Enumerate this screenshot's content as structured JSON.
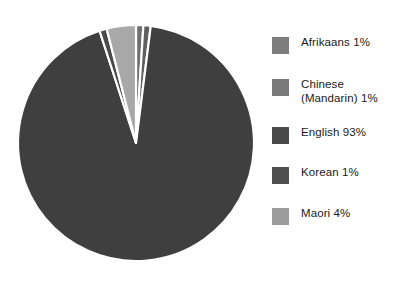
{
  "chart_data": {
    "type": "pie",
    "title": "",
    "subtitle": "",
    "xlabel": "",
    "ylabel": "",
    "legend_position": "right",
    "grid": false,
    "start_angle_deg": 0,
    "direction": "clockwise",
    "categories": [
      "Afrikaans",
      "Chinese (Mandarin)",
      "English",
      "Korean",
      "Maori"
    ],
    "values": [
      1,
      1,
      93,
      1,
      4
    ],
    "units": "percent",
    "slice_colors": [
      "#6f6f6f",
      "#5f5f5f",
      "#3f3f3f",
      "#4a4a4a",
      "#a8a8a8"
    ],
    "separator_color": "#ffffff",
    "slices": [
      {
        "label": "Afrikaans",
        "value": 1,
        "value_text": "1%",
        "color": "#6f6f6f"
      },
      {
        "label": "Chinese (Mandarin)",
        "value": 1,
        "value_text": "1%",
        "color": "#5f5f5f"
      },
      {
        "label": "English",
        "value": 93,
        "value_text": "93%",
        "color": "#3f3f3f"
      },
      {
        "label": "Korean",
        "value": 1,
        "value_text": "1%",
        "color": "#4a4a4a"
      },
      {
        "label": "Maori",
        "value": 4,
        "value_text": "4%",
        "color": "#a8a8a8"
      }
    ]
  },
  "legend": {
    "items": [
      {
        "text": "Afrikaans 1%",
        "swatch": "#7d7d7d",
        "top": 6
      },
      {
        "text": "Chinese\n(Mandarin) 1%",
        "swatch": "#7a7a7a",
        "top": 48
      },
      {
        "text": "English 93%",
        "swatch": "#494949",
        "top": 96
      },
      {
        "text": "Korean 1%",
        "swatch": "#4f4f4f",
        "top": 136
      },
      {
        "text": "Maori 4%",
        "swatch": "#9c9c9c",
        "top": 177
      }
    ]
  },
  "geometry": {
    "center_x": 128,
    "center_y": 129,
    "radius": 118
  }
}
